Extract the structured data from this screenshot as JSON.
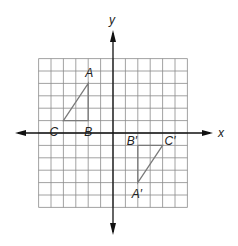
{
  "diagram": {
    "type": "coordinate-plane",
    "grid": {
      "x_min": -6,
      "x_max": 6,
      "y_min": -6,
      "y_max": 6,
      "cell_px": 12.4,
      "origin_px": [
        113,
        133
      ],
      "line_color": "#8a8a8a",
      "axis_color": "#111111"
    },
    "axes": {
      "x_label": "x",
      "y_label": "y"
    },
    "figures": [
      {
        "name": "triangle-ABC",
        "stroke": "#7a7a7a",
        "vertices": [
          {
            "label": "A",
            "x": -2,
            "y": 4,
            "label_dx": -3,
            "label_dy": -6
          },
          {
            "label": "B",
            "x": -2,
            "y": 1,
            "label_dx": -4,
            "label_dy": 15
          },
          {
            "label": "C",
            "x": -4,
            "y": 1,
            "label_dx": -14,
            "label_dy": 15
          }
        ]
      },
      {
        "name": "triangle-A-prime-B-prime-C-prime",
        "stroke": "#7a7a7a",
        "vertices": [
          {
            "label": "A′",
            "x": 2,
            "y": -4,
            "label_dx": -6,
            "label_dy": 15
          },
          {
            "label": "B′",
            "x": 2,
            "y": -1,
            "label_dx": -11,
            "label_dy": 0
          },
          {
            "label": "C′",
            "x": 4,
            "y": -1,
            "label_dx": 2,
            "label_dy": 0
          }
        ]
      }
    ]
  }
}
